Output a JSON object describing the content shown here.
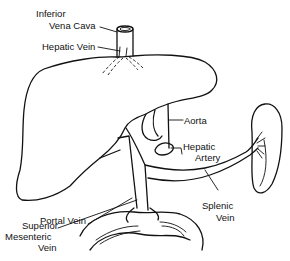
{
  "diagram": {
    "type": "anatomical-line-drawing",
    "labels": {
      "ivc_line1": "Inferior",
      "ivc_line2": "Vena Cava",
      "hepatic_vein": "Hepatic Vein",
      "aorta": "Aorta",
      "hepatic_artery_line1": "Hepatic",
      "hepatic_artery_line2": "Artery",
      "portal_vein": "Portal Vein",
      "smv_line1": "Superior",
      "smv_line2": "Mesenteric",
      "smv_line3": "Vein",
      "splenic_vein_line1": "Splenic",
      "splenic_vein_line2": "Vein"
    },
    "colors": {
      "ink": "#111111",
      "background": "#ffffff"
    }
  }
}
